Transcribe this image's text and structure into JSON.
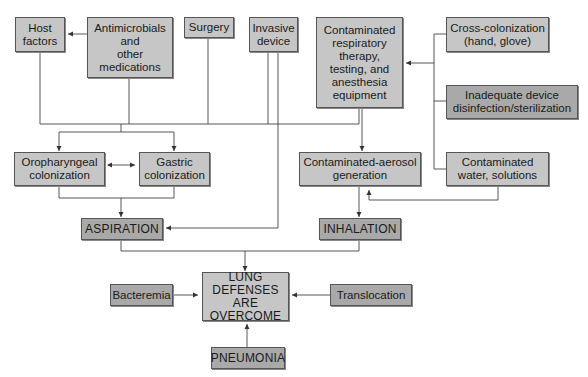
{
  "diagram": {
    "type": "flowchart",
    "nodes": {
      "host_factors": "Host\nfactors",
      "antimicrobials": "Antimicrobials\nand\nother\nmedications",
      "surgery": "Surgery",
      "invasive_device": "Invasive\ndevice",
      "contaminated_equipment": "Contaminated\nrespiratory\ntherapy,\ntesting, and\nanesthesia\nequipment",
      "cross_colonization": "Cross-colonization\n(hand, glove)",
      "inadequate_disinfection": "Inadequate device\ndisinfection/sterilization",
      "oropharyngeal": "Oropharyngeal\ncolonization",
      "gastric": "Gastric\ncolonization",
      "aerosol": "Contaminated-aerosol\ngeneration",
      "water": "Contaminated\nwater, solutions",
      "aspiration": "ASPIRATION",
      "inhalation": "INHALATION",
      "lung_defenses": "LUNG DEFENSES\nARE\nOVERCOME",
      "bacteremia": "Bacteremia",
      "translocation": "Translocation",
      "pneumonia": "PNEUMONIA"
    },
    "edges": [
      {
        "from": "antimicrobials",
        "to": "host_factors"
      },
      {
        "from": "host_factors",
        "to": "oropharyngeal"
      },
      {
        "from": "host_factors",
        "to": "gastric"
      },
      {
        "from": "antimicrobials",
        "to": "oropharyngeal"
      },
      {
        "from": "antimicrobials",
        "to": "gastric"
      },
      {
        "from": "surgery",
        "to": "oropharyngeal"
      },
      {
        "from": "surgery",
        "to": "gastric"
      },
      {
        "from": "invasive_device",
        "to": "oropharyngeal"
      },
      {
        "from": "invasive_device",
        "to": "gastric"
      },
      {
        "from": "invasive_device",
        "to": "aspiration"
      },
      {
        "from": "contaminated_equipment",
        "to": "oropharyngeal"
      },
      {
        "from": "contaminated_equipment",
        "to": "gastric"
      },
      {
        "from": "contaminated_equipment",
        "to": "aerosol"
      },
      {
        "from": "cross_colonization",
        "to": "contaminated_equipment"
      },
      {
        "from": "inadequate_disinfection",
        "to": "contaminated_equipment"
      },
      {
        "from": "water",
        "to": "contaminated_equipment"
      },
      {
        "from": "water",
        "to": "aerosol"
      },
      {
        "from": "oropharyngeal",
        "to": "gastric",
        "bidirectional": true
      },
      {
        "from": "oropharyngeal",
        "to": "aspiration"
      },
      {
        "from": "gastric",
        "to": "aspiration"
      },
      {
        "from": "aerosol",
        "to": "inhalation"
      },
      {
        "from": "aspiration",
        "to": "lung_defenses"
      },
      {
        "from": "inhalation",
        "to": "lung_defenses"
      },
      {
        "from": "bacteremia",
        "to": "lung_defenses"
      },
      {
        "from": "translocation",
        "to": "lung_defenses"
      },
      {
        "from": "pneumonia",
        "to": "lung_defenses"
      }
    ]
  },
  "colors": {
    "box_fill": "#c6c6c6",
    "box_fill_dark": "#a9a9a9",
    "line": "#444444",
    "background": "#ffffff"
  }
}
